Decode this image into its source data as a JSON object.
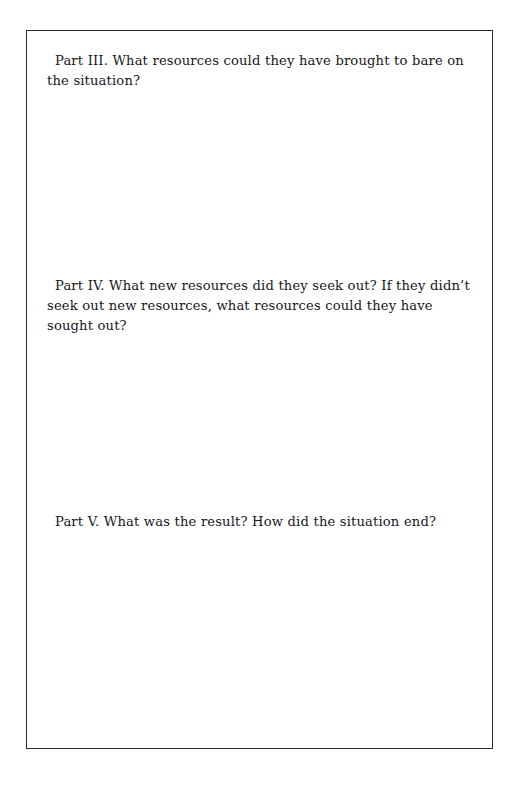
{
  "page": {
    "background_color": "#ffffff",
    "border_color": "#2b2b2e",
    "text_color": "#16161a"
  },
  "document": {
    "questions": [
      {
        "id": "part-iii",
        "label": "Part III.",
        "text": "Part III. What resources could they have brought to bare on the situation?"
      },
      {
        "id": "part-iv",
        "label": "Part IV.",
        "text": "Part IV. What new resources did they seek out? If they didn’t seek out new resources, what resources could they have sought out?"
      },
      {
        "id": "part-v",
        "label": "Part V.",
        "text": "Part V. What was the result? How did the situation end?"
      }
    ]
  }
}
